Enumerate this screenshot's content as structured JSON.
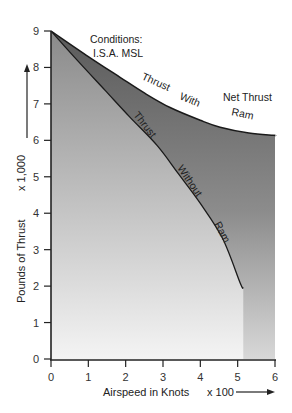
{
  "chart_data": {
    "type": "area",
    "title": "",
    "xlabel": "Airspeed in Knots",
    "xlabel_multiplier": "x 100",
    "ylabel": "Pounds of Thrust",
    "ylabel_multiplier": "x 1,000",
    "xlim": [
      0,
      6
    ],
    "ylim": [
      0,
      9
    ],
    "x_ticks": [
      "0",
      "1",
      "2",
      "3",
      "4",
      "5",
      "6"
    ],
    "y_ticks": [
      "0",
      "1",
      "2",
      "3",
      "4",
      "5",
      "6",
      "7",
      "8",
      "9"
    ],
    "grid": false,
    "legend": "none",
    "series": [
      {
        "name": "Thrust With Ram",
        "label_words": [
          "Thrust",
          "With",
          "Ram"
        ],
        "x": [
          0,
          1,
          1.85,
          2.5,
          3.19,
          4.0,
          4.53,
          5.3,
          5.95,
          6.0
        ],
        "y": [
          9.0,
          8.3,
          7.73,
          7.3,
          6.9,
          6.55,
          6.36,
          6.2,
          6.14,
          6.14
        ]
      },
      {
        "name": "Thrust Without Ram",
        "label_words": [
          "Thrust",
          "Without",
          "Ram"
        ],
        "x": [
          0,
          0.7,
          1.45,
          2.1,
          2.84,
          3.4,
          4.0,
          4.6,
          5.07,
          5.15
        ],
        "y": [
          9.0,
          8.2,
          7.37,
          6.65,
          5.86,
          5.1,
          4.27,
          3.3,
          2.08,
          1.95
        ]
      }
    ],
    "annotations": {
      "conditions_line1": "Conditions:",
      "conditions_line2": "I.S.A.  MSL",
      "net_thrust": "Net Thrust"
    },
    "colors": {
      "without_ram_fill_top": "#8a8a8a",
      "without_ram_fill_bottom": "#f4f4f4",
      "ram_band_top": "#5a5a5a",
      "ram_band_bottom": "#d8d8d8",
      "line": "#1a1a1a"
    }
  }
}
